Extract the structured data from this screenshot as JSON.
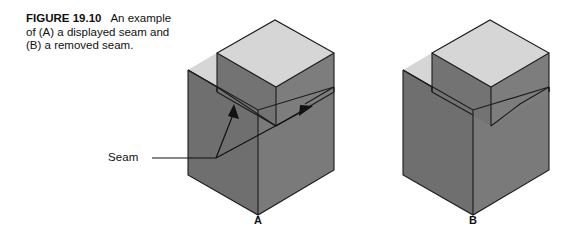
{
  "figure": {
    "number": "FIGURE 19.10",
    "caption_text": "An example of (A) a displayed seam and (B) a removed seam.",
    "caption_line1": "An",
    "caption_line2": "example of (A) a",
    "caption_line3": "displayed seam and (B)",
    "caption_line4": "a removed seam."
  },
  "annotations": {
    "seam_label": "Seam"
  },
  "parts": [
    {
      "id": "a",
      "label": "A",
      "description": "solid with displayed seam"
    },
    {
      "id": "b",
      "label": "B",
      "description": "solid with removed seam"
    }
  ],
  "colors": {
    "background": "#ffffff",
    "top_face": "#d6d6d6",
    "left_face": "#6f6f6f",
    "right_face": "#7a7a7a",
    "block_left_face": "#737373",
    "block_right_face": "#7d7d7d",
    "edge_stroke": "#1b1b1b",
    "text": "#111111"
  }
}
